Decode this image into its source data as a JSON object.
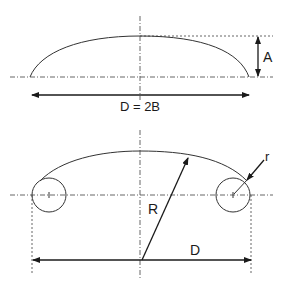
{
  "figure": {
    "top_diagram": {
      "name": "elliptical-head",
      "height_label": "A",
      "width_label": "D = 2B"
    },
    "bottom_diagram": {
      "name": "torispherical-head",
      "crown_radius_label": "R",
      "knuckle_radius_label": "r",
      "diameter_label": "D"
    },
    "colors": {
      "line": "#333333",
      "centerline": "#555555",
      "background": "#ffffff"
    }
  }
}
